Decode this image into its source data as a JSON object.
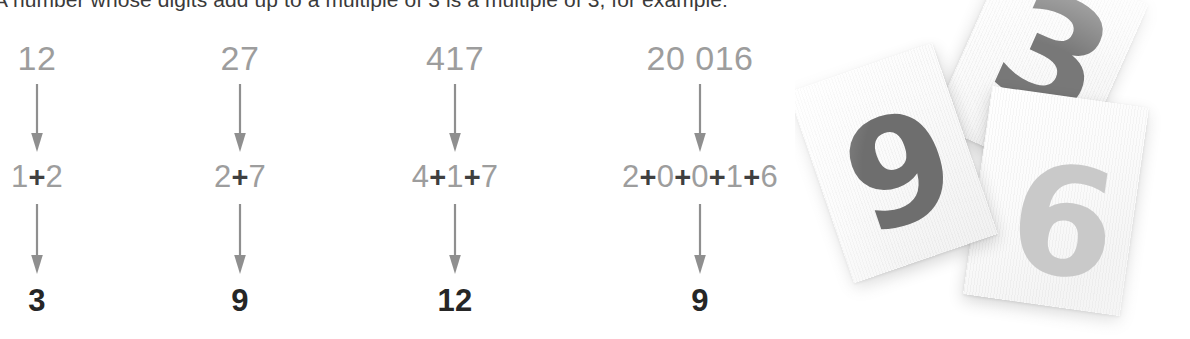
{
  "intro": {
    "text": "A number whose digits add up to a multiple of 3 is a multiple of 3, for example:"
  },
  "examples": [
    {
      "start": "12",
      "sum_parts": [
        "1",
        "2"
      ],
      "sum_display": "1+2",
      "result": "3",
      "center_x": 37
    },
    {
      "start": "27",
      "sum_parts": [
        "2",
        "7"
      ],
      "sum_display": "2+7",
      "result": "9",
      "center_x": 240
    },
    {
      "start": "417",
      "sum_parts": [
        "4",
        "1",
        "7"
      ],
      "sum_display": "4+1+7",
      "result": "12",
      "center_x": 455
    },
    {
      "start": "20 016",
      "sum_parts": [
        "2",
        "0",
        "0",
        "1",
        "6"
      ],
      "sum_display": "2+0+0+1+6",
      "result": "9",
      "center_x": 700
    }
  ],
  "operator": {
    "plus": "+"
  },
  "arrow": {
    "name": "down-arrow",
    "color": "#8f8f8f"
  },
  "photo": {
    "caption_alt": "photograph of three tilted paper cards showing printed numerals",
    "cards": [
      {
        "digit": "3",
        "color": "#787878"
      },
      {
        "digit": "9",
        "color": "#6e6e6e"
      },
      {
        "digit": "6",
        "color": "#c9c9c9"
      }
    ]
  },
  "colors": {
    "background": "#ffffff",
    "gray_digit": "#9d9d9d",
    "dark_text": "#262626",
    "body_text": "#3a3a3a",
    "plus_sign": "#3f3f3f",
    "arrow": "#8f8f8f"
  }
}
